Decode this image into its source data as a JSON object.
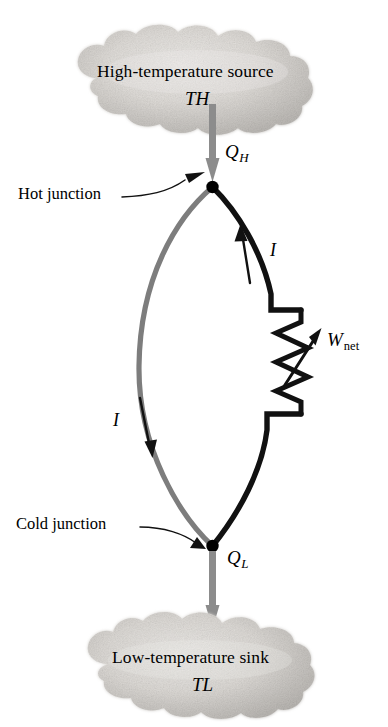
{
  "figure": {
    "name": "thermoelectric-power-generator",
    "background_color": "#ffffff",
    "width": 388,
    "height": 727
  },
  "sources": {
    "hot": {
      "title": "High-temperature source",
      "temperature_symbol": "T",
      "temperature_subscript": "H"
    },
    "cold": {
      "title": "Low-temperature sink",
      "temperature_symbol": "T",
      "temperature_subscript": "L"
    }
  },
  "heat_flows": [
    {
      "id": "q-h",
      "symbol": "Q",
      "subscript": "H",
      "direction": "down",
      "color": "#8c8c8c"
    },
    {
      "id": "q-l",
      "symbol": "Q",
      "subscript": "L",
      "direction": "down",
      "color": "#8c8c8c"
    }
  ],
  "junctions": [
    {
      "id": "hot-junction",
      "label": "Hot junction",
      "color": "#000000"
    },
    {
      "id": "cold-junction",
      "label": "Cold junction",
      "color": "#000000"
    }
  ],
  "currents": [
    {
      "id": "current-right",
      "symbol": "I",
      "direction": "up",
      "wire": "right-black-wire"
    },
    {
      "id": "current-left",
      "symbol": "I",
      "direction": "down",
      "wire": "left-gray-wire"
    }
  ],
  "work_output": {
    "symbol": "W",
    "subscript": "net",
    "component": "resistor",
    "direction": "out"
  },
  "wires": {
    "left": {
      "name": "left-gray-wire",
      "color": "#7d7d7d",
      "material": "conductor-a"
    },
    "right": {
      "name": "right-black-wire",
      "color": "#111111",
      "material": "conductor-b"
    }
  },
  "colors": {
    "cloud_fill": "#c9c7c4",
    "cloud_highlight": "#e6e4e1",
    "arrow_gray": "#8c8c8c",
    "wire_gray": "#7d7d7d",
    "wire_black": "#111111",
    "text": "#000000"
  }
}
